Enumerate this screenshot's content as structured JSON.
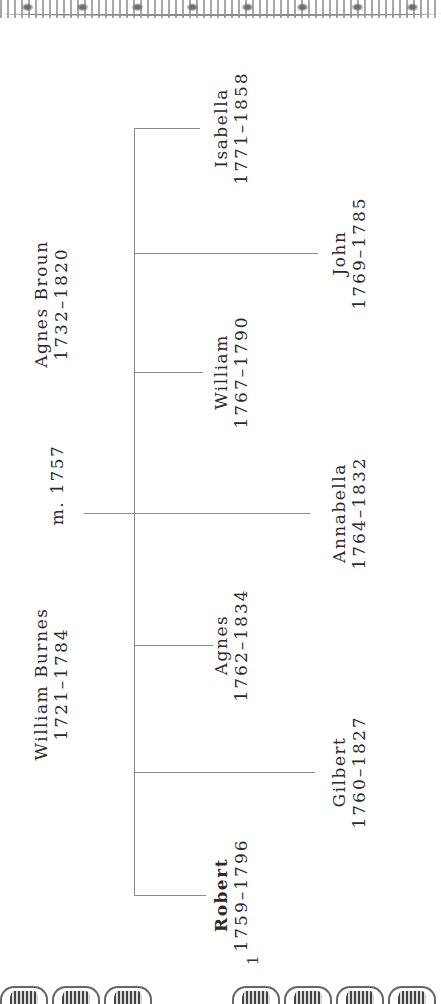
{
  "page": {
    "number": "1",
    "orientation": "rotated -90deg"
  },
  "parents": {
    "father": {
      "name": "William Burnes",
      "years": "1721–1784"
    },
    "mother": {
      "name": "Agnes Broun",
      "years": "1732–1820"
    },
    "marriage": "m. 1757"
  },
  "children": [
    {
      "name": "Robert",
      "years": "1759–1796",
      "emphasis": "bold"
    },
    {
      "name": "Gilbert",
      "years": "1760–1827"
    },
    {
      "name": "Agnes",
      "years": "1762–1834"
    },
    {
      "name": "Annabella",
      "years": "1764–1832"
    },
    {
      "name": "William",
      "years": "1767–1790"
    },
    {
      "name": "John",
      "years": "1769–1785"
    },
    {
      "name": "Isabella",
      "years": "1771–1858"
    }
  ],
  "colors": {
    "line": "#8a8a8a",
    "text": "#2a2a2a",
    "background": "#ffffff"
  }
}
